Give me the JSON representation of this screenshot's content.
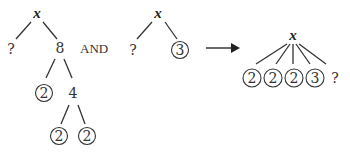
{
  "diagram": {
    "tree1": {
      "root": "x",
      "left": "?",
      "right": "8",
      "level2_left": "2",
      "level2_right": "4",
      "level3_left": "2",
      "level3_right": "2"
    },
    "connector": "AND",
    "tree2": {
      "root": "x",
      "left": "?",
      "right": "3"
    },
    "arrow": "right-arrow",
    "tree3": {
      "root": "x",
      "children": [
        "2",
        "2",
        "2",
        "3",
        "?"
      ]
    }
  },
  "colors": {
    "ink": "#333333",
    "background": "#ffffff"
  }
}
